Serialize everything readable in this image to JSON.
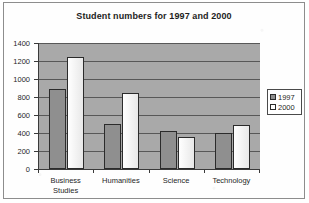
{
  "chart_data": {
    "type": "bar",
    "title": "Student numbers for 1997 and 2000",
    "xlabel": "",
    "ylabel": "",
    "categories": [
      "Business\nStudies",
      "Humanities",
      "Science",
      "Technology"
    ],
    "series": [
      {
        "name": "1997",
        "values": [
          890,
          505,
          420,
          400
        ],
        "color": "#8f8f8f"
      },
      {
        "name": "2000",
        "values": [
          1250,
          840,
          360,
          490
        ],
        "color": "#ffffff"
      }
    ],
    "ylim": [
      0,
      1400
    ],
    "ytick_step": 200,
    "ytick_labels": [
      "1400",
      "1200",
      "1000",
      "800",
      "600",
      "400",
      "200",
      "0"
    ],
    "ytick_values": [
      1400,
      1200,
      1000,
      800,
      600,
      400,
      200,
      0
    ],
    "grid": true,
    "legend_position": "right",
    "plot_background": "#a9a9a9"
  },
  "legend": {
    "entries": [
      {
        "label": "1997"
      },
      {
        "label": "2000"
      }
    ]
  }
}
